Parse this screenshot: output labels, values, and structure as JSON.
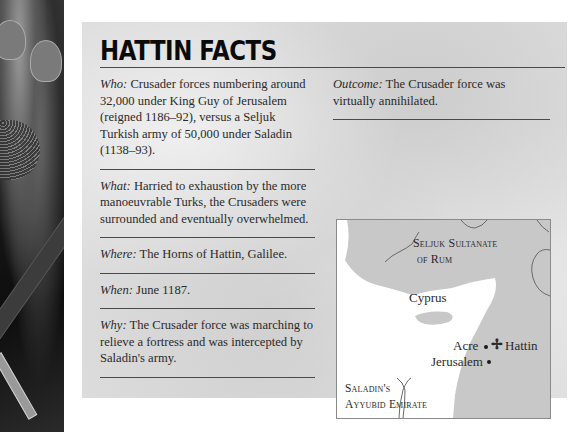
{
  "title": "HATTIN FACTS",
  "facts_left": [
    {
      "label": "Who:",
      "text": " Crusader forces numbering around 32,000 under King Guy of Jerusalem (reigned 1186–92), versus a Seljuk Turkish army of 50,000 under Saladin (1138–93)."
    },
    {
      "label": "What:",
      "text": " Harried to exhaustion by the more manoeuvrable Turks, the Crusaders were surrounded and eventually overwhelmed."
    },
    {
      "label": "Where:",
      "text": " The Horns of Hattin, Galilee."
    },
    {
      "label": "When:",
      "text": " June 1187."
    },
    {
      "label": "Why:",
      "text": " The Crusader force was marching to relieve a fortress and was intercepted by Saladin's army."
    }
  ],
  "facts_right": [
    {
      "label": "Outcome:",
      "text": " The Crusader force was virtually annihilated."
    }
  ],
  "map": {
    "region_north": "Seljuk Sultanate of Rum",
    "region_north_line1": "Seljuk Sultanate",
    "region_north_line2": "of Rum",
    "island": "Cyprus",
    "city_acre": "Acre",
    "battle_site": "Hattin",
    "battle_marker": "✢",
    "city_jerusalem": "Jerusalem",
    "region_south_line1": "Saladin's",
    "region_south_line2": "Ayyubid Emirate"
  },
  "colors": {
    "card_bg": "#dcdcdc",
    "land": "#c8c8c8",
    "sea": "#ffffff",
    "rule": "#4a4a4a",
    "text": "#2a2a2a"
  }
}
